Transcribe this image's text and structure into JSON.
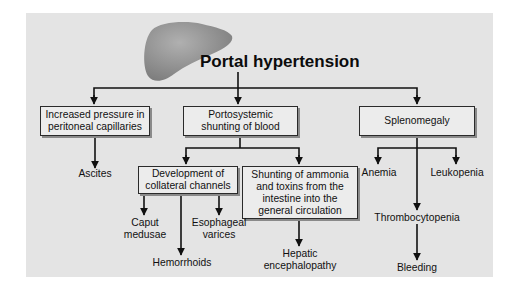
{
  "title": "Portal hypertension",
  "icons": {
    "organ": "liver-icon"
  },
  "colors": {
    "panel_background": "#e4e4e4",
    "box_background": "#ececec",
    "line": "#111111",
    "liver": "#9a9a9a"
  },
  "level1": {
    "pressure_box": "Increased pressure in\nperitoneal capillaries",
    "shunting_box": "Portosystemic\nshunting of blood",
    "splenomegaly_box": "Splenomegaly"
  },
  "level2": {
    "ascites": "Ascites",
    "collateral_box": "Development of\ncollateral channels",
    "ammonia_box": "Shunting of ammonia\nand toxins from the\nintestine into the\ngeneral circulation",
    "anemia": "Anemia",
    "leukopenia": "Leukopenia",
    "thrombocytopenia": "Thrombocytopenia"
  },
  "level3": {
    "caput_medusae": "Caput\nmedusae",
    "esophageal_varices": "Esophageal\nvarices",
    "hemorrhoids": "Hemorrhoids",
    "hepatic_encephalopathy": "Hepatic\nencephalopathy",
    "bleeding": "Bleeding"
  }
}
